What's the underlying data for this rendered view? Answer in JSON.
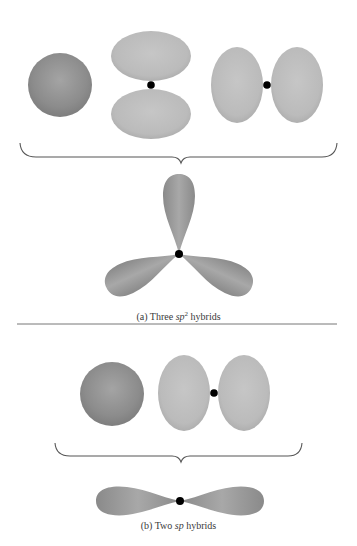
{
  "figure": {
    "panel_a": {
      "caption_prefix": "(a) Three ",
      "caption_italic": "sp",
      "caption_sup": "2",
      "caption_suffix": " hybrids",
      "input_orbitals": [
        "s",
        "p (vertical)",
        "p (horizontal)"
      ],
      "result": "three sp2 hybrid lobes, trigonal planar at 120°"
    },
    "panel_b": {
      "caption_prefix": "(b) Two ",
      "caption_italic": "sp",
      "caption_suffix": " hybrids",
      "input_orbitals": [
        "s",
        "p (horizontal)"
      ],
      "result": "two sp hybrid lobes, linear at 180°"
    },
    "colors": {
      "s_orbital": "#8a8a8a",
      "p_orbital": "#bcbcbc",
      "hybrid_orbital": "#9a9a9a",
      "nucleus": "#000000",
      "brace": "#555555",
      "divider": "#777777"
    }
  }
}
